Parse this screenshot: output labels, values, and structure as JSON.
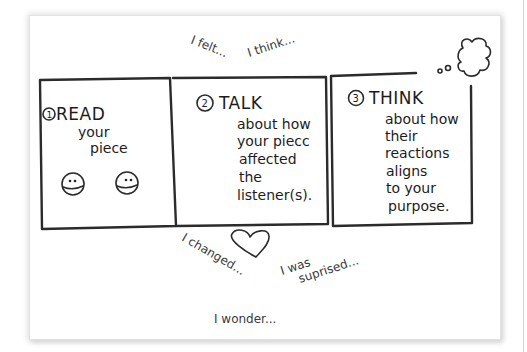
{
  "diagram": {
    "type": "hand-drawn three-step process",
    "ink_color": "#2b2b2b",
    "background": "#ffffff",
    "steps": [
      {
        "number": "1",
        "title": "READ",
        "body_lines": [
          "your",
          "piece"
        ],
        "decoration": "two smiley faces"
      },
      {
        "number": "2",
        "title": "TALK",
        "body_lines": [
          "about how",
          "your piecc",
          "affected",
          "the",
          "listener(s)."
        ]
      },
      {
        "number": "3",
        "title": "THINK",
        "body_lines": [
          "about how",
          "their",
          "reactions",
          "aligns",
          "to your",
          "purpose."
        ],
        "decoration": "thought bubble"
      }
    ],
    "annotations": {
      "i_felt": "I felt...",
      "i_think": "I think...",
      "i_changed": "I changed...",
      "i_was_surprised_1": "I was",
      "i_was_surprised_2": "suprised...",
      "i_wonder": "I wonder..."
    },
    "heart": "heart-doodle"
  }
}
